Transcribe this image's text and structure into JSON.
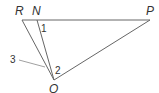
{
  "diagram": {
    "points": {
      "R": {
        "label": "R",
        "x": 22,
        "y": 20
      },
      "N": {
        "label": "N",
        "x": 37,
        "y": 20
      },
      "P": {
        "label": "P",
        "x": 150,
        "y": 20
      },
      "Q": {
        "label": "Q",
        "x": 54,
        "y": 80
      }
    },
    "angles": [
      {
        "label": "1",
        "at": "N"
      },
      {
        "label": "2",
        "at": "Q"
      },
      {
        "label": "3",
        "at": "Q",
        "note": "indicated by leader line"
      }
    ],
    "segments": [
      "RP",
      "RQ",
      "NQ",
      "PQ"
    ],
    "line_color": "#666666",
    "text_color": "#333333"
  }
}
